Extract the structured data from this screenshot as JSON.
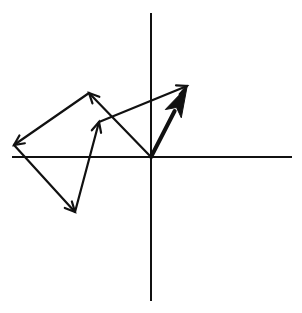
{
  "diagram": {
    "type": "vector-addition",
    "colors": {
      "background": "#ffffff",
      "stroke": "#111111"
    },
    "axes": {
      "origin": [
        151,
        157
      ],
      "horizontal": {
        "from": [
          12,
          157
        ],
        "to": [
          292,
          157
        ]
      },
      "vertical": {
        "from": [
          151,
          13
        ],
        "to": [
          151,
          301
        ]
      }
    },
    "vectors": [
      {
        "id": "v1",
        "from": [
          151,
          157
        ],
        "to": [
          89,
          93
        ]
      },
      {
        "id": "v2",
        "from": [
          89,
          93
        ],
        "to": [
          14,
          145
        ]
      },
      {
        "id": "v3",
        "from": [
          14,
          145
        ],
        "to": [
          75,
          212
        ]
      },
      {
        "id": "v4",
        "from": [
          75,
          212
        ],
        "to": [
          99,
          122
        ]
      },
      {
        "id": "v5",
        "from": [
          99,
          122
        ],
        "to": [
          187,
          86
        ]
      }
    ],
    "resultant": {
      "id": "resultant",
      "from": [
        151,
        157
      ],
      "to": [
        187,
        87
      ],
      "thick": true
    }
  }
}
